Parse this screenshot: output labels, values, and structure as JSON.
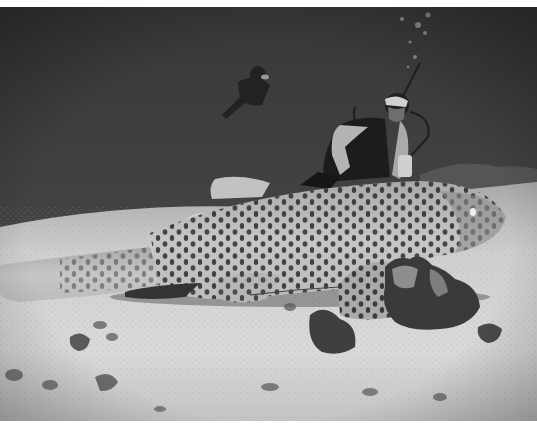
{
  "image": {
    "description": "Black-and-white underwater photograph: a large spotted leopard (zebra) shark resting on a sandy seabed with coral clumps, a kneeling scuba diver behind it and a second diver swimming in the distance, with rising bubbles.",
    "style": "grayscale photograph",
    "subjects": [
      "leopard-shark",
      "diver-kneeling",
      "diver-swimming",
      "bubbles",
      "coral-clumps",
      "sandy-seabed"
    ],
    "colors": {
      "water_dark": "#3a3a3a",
      "water_mid": "#4a4a4a",
      "sand_light": "#d8d8d8",
      "sand_mid": "#b8b8b8",
      "shark_body": "#bdbdbd",
      "shark_spots": "#2a2a2a",
      "coral": "#3c3c3c",
      "border": "#ffffff"
    }
  }
}
